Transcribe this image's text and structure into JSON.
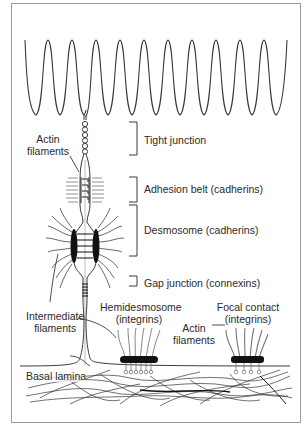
{
  "figure": {
    "labels": {
      "actin_top": [
        "Actin",
        "filaments"
      ],
      "tight_junction": "Tight junction",
      "adhesion_belt": "Adhesion belt (cadherins)",
      "desmosome": "Desmosome (cadherins)",
      "gap_junction": "Gap junction (connexins)",
      "intermediate": [
        "Intermediate",
        "filaments"
      ],
      "hemidesmosome": [
        "Hemidesmosome",
        "(integrins)"
      ],
      "focal_contact": [
        "Focal contact",
        "(integrins)"
      ],
      "actin_bottom": [
        "Actin",
        "filaments"
      ],
      "basal_lamina": "Basal lamina"
    },
    "colors": {
      "line": "#3a3a3a",
      "frame": "#9a9a9a",
      "plaque": "#111111",
      "background": "#ffffff"
    }
  }
}
